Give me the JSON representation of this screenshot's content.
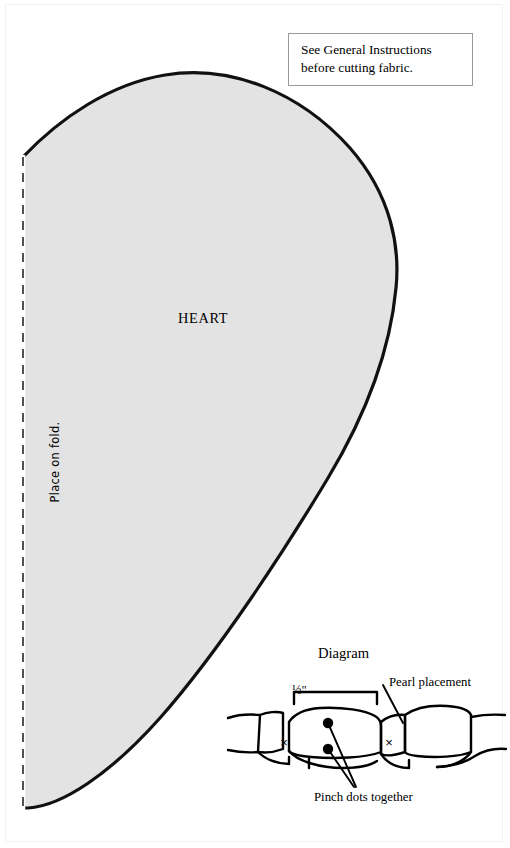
{
  "page": {
    "width": 510,
    "height": 848,
    "background_color": "#ffffff",
    "document_type": "sewing-pattern-sheet"
  },
  "instruction_box": {
    "line1": "See General Instructions",
    "line2": "before cutting fabric.",
    "border_color": "#9a9a9a"
  },
  "pattern_piece": {
    "label": "HEART",
    "fold_label": "Place on fold.",
    "fill_color": "#e3e3e3",
    "outline_color": "#000000",
    "fold_line_style": "dashed"
  },
  "diagram": {
    "title": "Diagram",
    "measurement_label": "½\"",
    "pearl_label": "Pearl placement",
    "pinch_label": "Pinch dots together",
    "mark_x_left": "×",
    "mark_x_right": "×",
    "line_color": "#000000",
    "dot_color": "#000000"
  }
}
